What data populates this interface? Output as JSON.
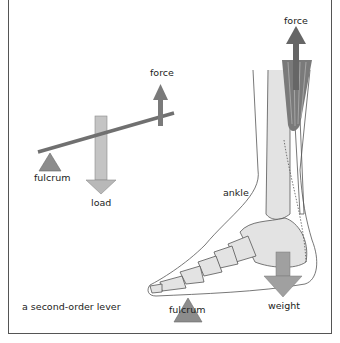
{
  "diagram": {
    "caption": "a second-order lever",
    "lever": {
      "force_label": "force",
      "fulcrum_label": "fulcrum",
      "load_label": "load"
    },
    "foot": {
      "force_label": "force",
      "ankle_label": "ankle",
      "fulcrum_label": "fulcrum",
      "weight_label": "weight"
    },
    "colors": {
      "arrow_gray": "#9a9a9a",
      "dark_arrow": "#6f6f6f",
      "fulcrum": "#8c8c8c",
      "bone": "#e3e3e3",
      "outline": "#555555"
    }
  }
}
